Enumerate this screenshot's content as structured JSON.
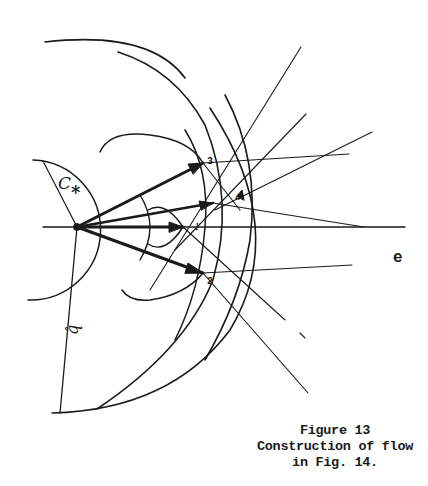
{
  "figure": {
    "caption": {
      "line1": "Figure 13",
      "line2": "Construction of flow",
      "line3": "in Fig. 14."
    },
    "labels": {
      "c_star": "C",
      "c_star_sub": "*",
      "q_hat": "q̂",
      "e_axis": "e",
      "point_1": "1",
      "point_2": "2",
      "point_3": "3",
      "point_4": "4"
    },
    "colors": {
      "ink": "#1a1a1a",
      "paper": "#ffffff"
    }
  }
}
